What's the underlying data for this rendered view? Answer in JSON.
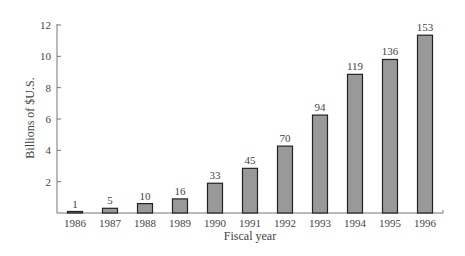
{
  "chart_data": {
    "type": "bar",
    "title": "",
    "xlabel": "Fiscal year",
    "ylabel": "Billions of $U.S.",
    "ylim": [
      0,
      12
    ],
    "yticks": [
      2,
      4,
      6,
      8,
      10,
      12
    ],
    "grid": false,
    "categories": [
      "1986",
      "1987",
      "1988",
      "1989",
      "1990",
      "1991",
      "1992",
      "1993",
      "1994",
      "1995",
      "1996"
    ],
    "values": [
      0.08,
      0.3,
      0.6,
      0.9,
      1.9,
      2.85,
      4.27,
      6.25,
      8.85,
      9.8,
      11.35
    ],
    "bar_labels": [
      "1",
      "5",
      "10",
      "16",
      "33",
      "45",
      "70",
      "94",
      "119",
      "136",
      "153"
    ],
    "bar_color": "#999999",
    "bar_edge_color": "#222222"
  }
}
